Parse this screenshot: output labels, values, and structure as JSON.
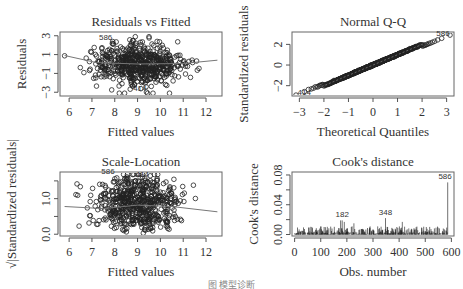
{
  "caption": "图 模型诊断",
  "chart_data": [
    {
      "type": "scatter",
      "title": "Residuals vs Fitted",
      "xlabel": "Fitted values",
      "ylabel": "Residuals",
      "xlim": [
        5.6,
        12.7
      ],
      "ylim": [
        -3.4,
        3.4
      ],
      "xticks": [
        6,
        7,
        8,
        9,
        10,
        11,
        12
      ],
      "yticks": [
        -3,
        -1,
        1,
        3
      ],
      "ytick_labels": [
        "−3",
        "−1",
        "1",
        "3"
      ],
      "n_points": 586,
      "center_x": 9.0,
      "annotations": [
        {
          "label": "586",
          "x": 7.6,
          "y": 2.6
        },
        {
          "label": "414",
          "x": 9.1,
          "y": -2.9
        }
      ],
      "smooth_line": [
        [
          5.8,
          0.9
        ],
        [
          7.2,
          0.15
        ],
        [
          9.0,
          0.0
        ],
        [
          11,
          0.05
        ],
        [
          12.5,
          0.4
        ]
      ]
    },
    {
      "type": "scatter",
      "title": "Normal Q-Q",
      "xlabel": "Theoretical Quantiles",
      "ylabel": "Standardized residuals",
      "xlim": [
        -3.3,
        3.3
      ],
      "ylim": [
        -3.0,
        3.2
      ],
      "xticks": [
        -3,
        -2,
        -1,
        0,
        1,
        2,
        3
      ],
      "xtick_labels": [
        "−3",
        "−2",
        "−1",
        "0",
        "1",
        "2",
        "3"
      ],
      "yticks": [
        -2,
        0,
        2
      ],
      "ytick_labels": [
        "−2",
        "0",
        "2"
      ],
      "n_points": 586,
      "annotations": [
        {
          "label": "586",
          "x": 2.85,
          "y": 2.8
        },
        {
          "label": "414",
          "x": -2.8,
          "y": -2.9
        }
      ],
      "reference_line": [
        [
          -3.3,
          -3.3
        ],
        [
          3.3,
          3.3
        ]
      ]
    },
    {
      "type": "scatter",
      "title": "Scale-Location",
      "xlabel": "Fitted values",
      "ylabel": "√|Standardized residuals|",
      "xlim": [
        5.6,
        12.7
      ],
      "ylim": [
        -0.05,
        1.75
      ],
      "xticks": [
        6,
        7,
        8,
        9,
        10,
        11,
        12
      ],
      "yticks": [
        0.0,
        1.0
      ],
      "ytick_labels": [
        "0.0",
        "1.0"
      ],
      "extra_yticks": [
        0.5,
        1.5
      ],
      "n_points": 586,
      "annotations": [
        {
          "label": "586",
          "x": 7.7,
          "y": 1.68
        },
        {
          "label": "414",
          "x": 9.2,
          "y": 1.62
        }
      ],
      "smooth_line": [
        [
          5.8,
          0.78
        ],
        [
          7.5,
          0.72
        ],
        [
          9,
          0.82
        ],
        [
          10.5,
          0.78
        ],
        [
          12.5,
          0.63
        ]
      ]
    },
    {
      "type": "bar",
      "title": "Cook's distance",
      "xlabel": "Obs. number",
      "ylabel": "Cook's distance",
      "xlim": [
        -10,
        610
      ],
      "ylim": [
        -0.002,
        0.084
      ],
      "xticks": [
        0,
        100,
        200,
        300,
        400,
        500,
        600
      ],
      "yticks": [
        0.0,
        0.04,
        0.08
      ],
      "ytick_labels": [
        "0.00",
        "0.04",
        "0.08"
      ],
      "extra_yticks": [
        0.02,
        0.06
      ],
      "n_obs": 586,
      "highlights": [
        {
          "obs": 176,
          "value": 0.019
        },
        {
          "obs": 182,
          "value": 0.019
        },
        {
          "obs": 190,
          "value": 0.017
        },
        {
          "obs": 227,
          "value": 0.015
        },
        {
          "obs": 348,
          "value": 0.022
        },
        {
          "obs": 412,
          "value": 0.017
        },
        {
          "obs": 586,
          "value": 0.07
        }
      ],
      "annotations": [
        {
          "label": "182",
          "x": 182,
          "y": 0.023
        },
        {
          "label": "348",
          "x": 348,
          "y": 0.026
        },
        {
          "label": "586",
          "x": 576,
          "y": 0.074
        }
      ]
    }
  ]
}
